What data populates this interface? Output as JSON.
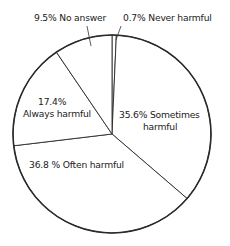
{
  "chart_data": {
    "type": "pie",
    "title": "",
    "start_angle_deg": 0,
    "direction": "clockwise",
    "slices": [
      {
        "label": "Never harmful",
        "value": 0.7,
        "text": "0.7% Never harmful"
      },
      {
        "label": "Sometimes harmful",
        "value": 35.6,
        "text_lines": [
          "35.6% Sometimes",
          "harmful"
        ]
      },
      {
        "label": "Often harmful",
        "value": 36.8,
        "text": "36.8 % Often harmful"
      },
      {
        "label": "Always harmful",
        "value": 17.4,
        "text_lines": [
          "17.4%",
          "Always harmful"
        ]
      },
      {
        "label": "No answer",
        "value": 9.5,
        "text": "9.5% No answer"
      }
    ],
    "unit": "%",
    "colors": {
      "stroke": "#2a2a2a",
      "fill": "#ffffff",
      "text": "#222222"
    }
  },
  "labels": {
    "no_answer": "9.5% No answer",
    "never_harmful": "0.7% Never harmful",
    "always_pct": "17.4%",
    "always_text": "Always harmful",
    "sometimes_line1": "35.6% Sometimes",
    "sometimes_line2": "harmful",
    "often": "36.8 % Often harmful"
  }
}
